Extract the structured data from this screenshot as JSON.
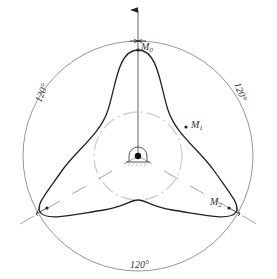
{
  "diagram": {
    "labels": {
      "m0": "M",
      "m0_sub": "0",
      "m1": "M",
      "m1_sub": "1",
      "m2": "M",
      "m2_sub": "2",
      "angle_left": "120°",
      "angle_right": "120°",
      "angle_bottom": "120°"
    },
    "colors": {
      "profile": "#222222",
      "outer_circle": "#8a8a8a",
      "inner_circle": "#cccccc",
      "center_lines": "#9a9a9a"
    }
  }
}
